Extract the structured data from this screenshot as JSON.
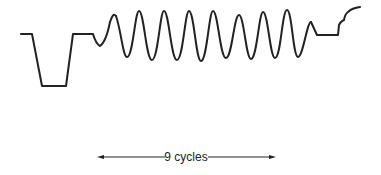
{
  "diagram": {
    "stroke_color": "#222222",
    "background": "#ffffff",
    "waveform": {
      "description": "Horizontal level, negative pulse, return to level, 9-cycle sinusoidal burst, level, rising step curve",
      "segments": [
        {
          "type": "level",
          "label": "initial level"
        },
        {
          "type": "pulse",
          "label": "negative pulse"
        },
        {
          "type": "level",
          "label": "back porch"
        },
        {
          "type": "burst",
          "label": "sine burst",
          "cycles": 9
        },
        {
          "type": "level",
          "label": "post-burst level"
        },
        {
          "type": "step",
          "label": "rising edge"
        }
      ]
    },
    "annotation": {
      "text": "9 cycles",
      "left_arrow": "arrow-left",
      "right_arrow": "arrow-right"
    }
  }
}
